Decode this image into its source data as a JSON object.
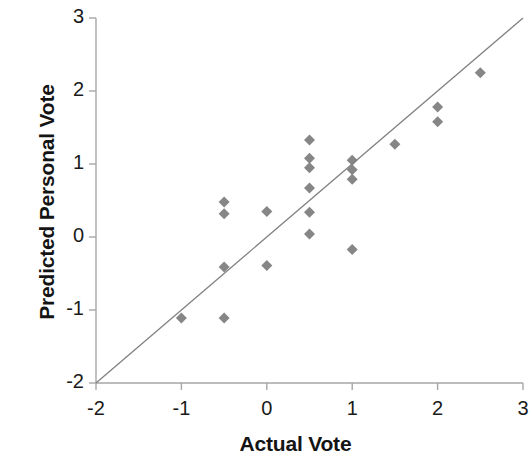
{
  "chart_data": {
    "type": "scatter",
    "title": "",
    "xlabel": "Actual Vote",
    "ylabel": "Predicted Personal Vote",
    "xlim": [
      -2,
      3
    ],
    "ylim": [
      -2,
      3
    ],
    "xticks": [
      -2,
      -1,
      0,
      1,
      2,
      3
    ],
    "yticks": [
      -2,
      -1,
      0,
      1,
      2,
      3
    ],
    "xtick_labels": [
      "-2",
      "-1",
      "0",
      "1",
      "2",
      "3"
    ],
    "ytick_labels": [
      "-2",
      "-1",
      "0",
      "1",
      "2",
      "3"
    ],
    "grid": false,
    "legend": null,
    "marker": "diamond",
    "marker_color": "#808080",
    "marker_size": 11,
    "series": [
      {
        "name": "Predicted vs Actual",
        "points": [
          {
            "x": -1.0,
            "y": -1.11
          },
          {
            "x": -0.5,
            "y": 0.48
          },
          {
            "x": -0.5,
            "y": 0.32
          },
          {
            "x": -0.5,
            "y": -0.41
          },
          {
            "x": -0.5,
            "y": -1.11
          },
          {
            "x": 0.0,
            "y": 0.35
          },
          {
            "x": 0.0,
            "y": -0.39
          },
          {
            "x": 0.5,
            "y": 1.33
          },
          {
            "x": 0.5,
            "y": 1.08
          },
          {
            "x": 0.5,
            "y": 0.95
          },
          {
            "x": 0.5,
            "y": 0.67
          },
          {
            "x": 0.5,
            "y": 0.34
          },
          {
            "x": 0.5,
            "y": 0.04
          },
          {
            "x": 1.0,
            "y": 1.05
          },
          {
            "x": 1.0,
            "y": 0.92
          },
          {
            "x": 1.0,
            "y": 0.79
          },
          {
            "x": 1.0,
            "y": -0.17
          },
          {
            "x": 1.5,
            "y": 1.27
          },
          {
            "x": 2.0,
            "y": 1.78
          },
          {
            "x": 2.0,
            "y": 1.58
          },
          {
            "x": 2.5,
            "y": 2.25
          }
        ]
      }
    ],
    "reference_line": {
      "name": "identity-line",
      "from": {
        "x": -2,
        "y": -2
      },
      "to": {
        "x": 3,
        "y": 3
      },
      "color": "#808080"
    },
    "axis_color": "#a6a6a6"
  }
}
